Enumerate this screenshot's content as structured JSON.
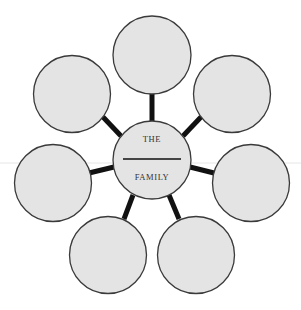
{
  "diagram": {
    "type": "family-web-organizer",
    "center": {
      "line1": "THE",
      "line2": "FAMILY",
      "has_blank_line": true
    },
    "satellite_count": 7,
    "satellites": [
      {
        "position": "top",
        "label": ""
      },
      {
        "position": "top-left",
        "label": ""
      },
      {
        "position": "top-right",
        "label": ""
      },
      {
        "position": "left",
        "label": ""
      },
      {
        "position": "right",
        "label": ""
      },
      {
        "position": "bottom-left",
        "label": ""
      },
      {
        "position": "bottom-right",
        "label": ""
      }
    ],
    "colors": {
      "circle_fill": "#e4e4e4",
      "circle_stroke": "#3a3a3a",
      "connector": "#111111",
      "background": "#ffffff"
    }
  }
}
